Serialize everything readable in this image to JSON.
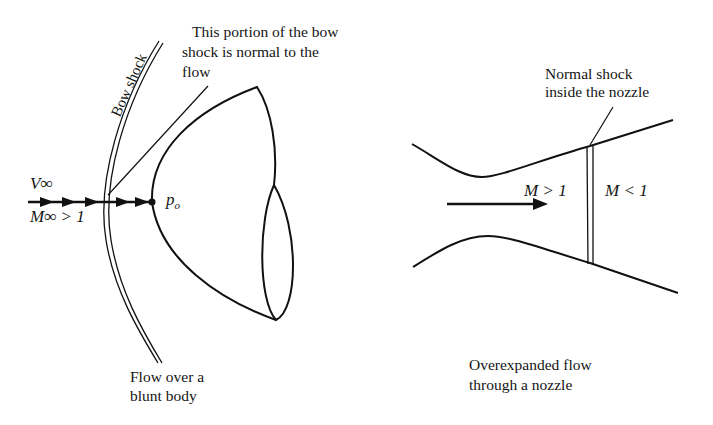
{
  "left_figure": {
    "callout_line1": "This portion of the bow",
    "callout_line2": "shock is normal to the",
    "callout_line3": "flow",
    "bow_shock_label": "Bow shock",
    "velocity_label": "V∞",
    "mach_label": "M∞ > 1",
    "stagnation_label": "p",
    "stagnation_sub": "o",
    "caption_line1": "Flow over a",
    "caption_line2": "blunt body"
  },
  "right_figure": {
    "callout_line1": "Normal shock",
    "callout_line2": "inside the nozzle",
    "upstream_mach": "M > 1",
    "downstream_mach": "M < 1",
    "caption_line1": "Overexpanded flow",
    "caption_line2": "through a nozzle"
  },
  "colors": {
    "ink": "#111111",
    "background": "#ffffff"
  }
}
